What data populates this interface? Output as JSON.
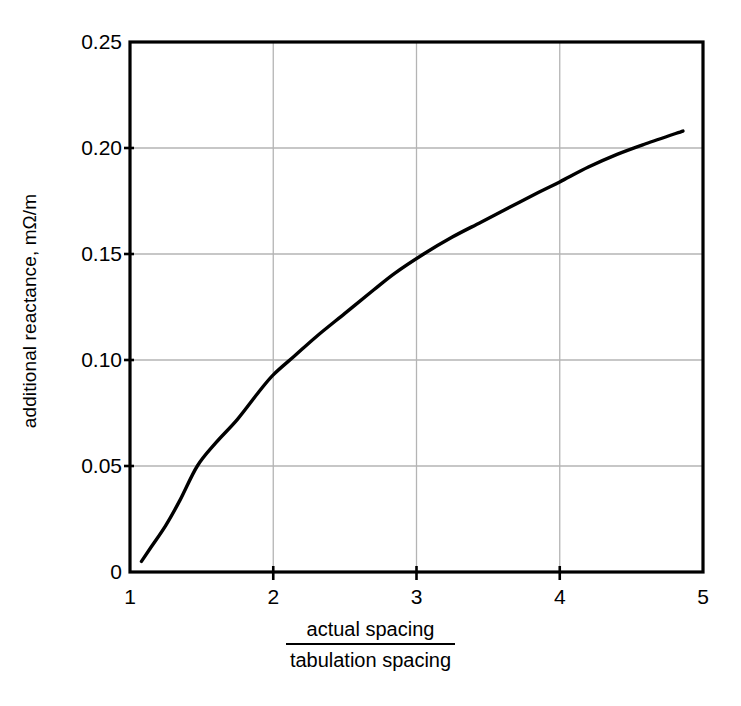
{
  "chart_data": {
    "type": "line",
    "title": "",
    "subtitle": "",
    "xlabel_numerator": "actual spacing",
    "xlabel_denominator": "tabulation spacing",
    "xlabel": "actual spacing / tabulation spacing",
    "ylabel": "additional reactance, mΩ/m",
    "xlim": [
      1,
      5
    ],
    "ylim": [
      0,
      0.25
    ],
    "xticks": [
      1,
      2,
      3,
      4,
      5
    ],
    "xtick_labels": [
      "1",
      "2",
      "3",
      "4",
      "5"
    ],
    "yticks": [
      0,
      0.05,
      0.1,
      0.15,
      0.2,
      0.25
    ],
    "ytick_labels": [
      "0",
      "0.05",
      "0.10",
      "0.15",
      "0.20",
      "0.25"
    ],
    "grid": true,
    "grid_color": "#b4b4b4",
    "legend": null,
    "line_color": "#000000",
    "line_width": 3.4,
    "series": [
      {
        "name": "additional reactance",
        "x": [
          1.08,
          1.15,
          1.25,
          1.35,
          1.47,
          1.6,
          1.75,
          1.9,
          2.0,
          2.15,
          2.3,
          2.5,
          2.7,
          2.85,
          3.05,
          3.25,
          3.45,
          3.65,
          3.85,
          4.0,
          4.2,
          4.4,
          4.6,
          4.86
        ],
        "y": [
          0.005,
          0.012,
          0.022,
          0.034,
          0.05,
          0.061,
          0.072,
          0.085,
          0.093,
          0.102,
          0.111,
          0.122,
          0.133,
          0.141,
          0.15,
          0.158,
          0.165,
          0.172,
          0.179,
          0.184,
          0.191,
          0.197,
          0.202,
          0.208
        ]
      }
    ],
    "annotations": []
  },
  "axis": {
    "y_ticks": [
      {
        "label": "0.25"
      },
      {
        "label": "0.20"
      },
      {
        "label": "0.15"
      },
      {
        "label": "0.10"
      },
      {
        "label": "0.05"
      },
      {
        "label": "0"
      }
    ],
    "x_ticks": [
      {
        "label": "1"
      },
      {
        "label": "2"
      },
      {
        "label": "3"
      },
      {
        "label": "4"
      },
      {
        "label": "5"
      }
    ],
    "y_axis_title": "additional reactance, mΩ/m",
    "x_axis_numerator": "actual spacing",
    "x_axis_denominator": "tabulation spacing"
  },
  "colors": {
    "frame": "#000000",
    "grid": "#b4b4b4",
    "curve": "#000000",
    "background": "#ffffff"
  }
}
